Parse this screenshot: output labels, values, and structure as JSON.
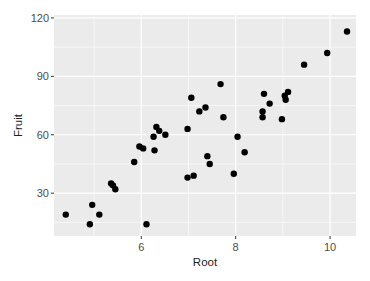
{
  "chart_data": {
    "type": "scatter",
    "title": "",
    "xlabel": "Root",
    "ylabel": "Fruit",
    "xlim": [
      4.15,
      10.55
    ],
    "ylim": [
      8,
      121.5
    ],
    "xticks": [
      6,
      8,
      10
    ],
    "yticks": [
      30,
      60,
      90,
      120
    ],
    "x_minor_gridlines": [
      5,
      7,
      9
    ],
    "y_minor_gridlines": [
      15,
      45,
      75,
      105
    ],
    "grid": true,
    "legend": null,
    "point_color": "#000000",
    "panel_background": "#ebebeb",
    "gridline_color": "#ffffff",
    "points": [
      {
        "x": 4.4,
        "y": 19
      },
      {
        "x": 4.96,
        "y": 24
      },
      {
        "x": 5.11,
        "y": 19
      },
      {
        "x": 4.91,
        "y": 14
      },
      {
        "x": 6.11,
        "y": 14
      },
      {
        "x": 5.36,
        "y": 35
      },
      {
        "x": 5.4,
        "y": 34
      },
      {
        "x": 5.45,
        "y": 32
      },
      {
        "x": 5.85,
        "y": 46
      },
      {
        "x": 5.96,
        "y": 54
      },
      {
        "x": 6.04,
        "y": 53
      },
      {
        "x": 6.28,
        "y": 52
      },
      {
        "x": 6.32,
        "y": 64
      },
      {
        "x": 6.38,
        "y": 62
      },
      {
        "x": 6.51,
        "y": 60
      },
      {
        "x": 6.26,
        "y": 59
      },
      {
        "x": 7.68,
        "y": 86
      },
      {
        "x": 7.06,
        "y": 79
      },
      {
        "x": 7.36,
        "y": 74
      },
      {
        "x": 7.23,
        "y": 72
      },
      {
        "x": 7.74,
        "y": 69
      },
      {
        "x": 6.98,
        "y": 63
      },
      {
        "x": 8.04,
        "y": 59
      },
      {
        "x": 8.19,
        "y": 51
      },
      {
        "x": 7.4,
        "y": 49
      },
      {
        "x": 7.45,
        "y": 45
      },
      {
        "x": 6.98,
        "y": 38
      },
      {
        "x": 7.11,
        "y": 39
      },
      {
        "x": 7.96,
        "y": 40
      },
      {
        "x": 10.36,
        "y": 113
      },
      {
        "x": 9.94,
        "y": 102
      },
      {
        "x": 9.45,
        "y": 96
      },
      {
        "x": 8.6,
        "y": 81
      },
      {
        "x": 9.11,
        "y": 82
      },
      {
        "x": 9.04,
        "y": 80
      },
      {
        "x": 9.06,
        "y": 78
      },
      {
        "x": 8.72,
        "y": 76
      },
      {
        "x": 8.57,
        "y": 72
      },
      {
        "x": 8.57,
        "y": 69
      },
      {
        "x": 8.98,
        "y": 68
      }
    ]
  }
}
